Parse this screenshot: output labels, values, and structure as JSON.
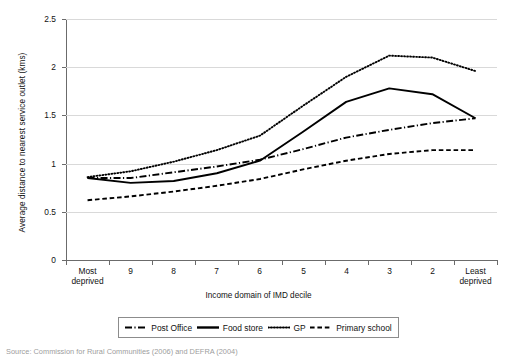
{
  "chart_data": {
    "type": "line",
    "title": "",
    "xlabel": "Income domain of IMD decile",
    "ylabel": "Average distance to nearest service outlet (kms)",
    "categories": [
      "Most deprived",
      "9",
      "8",
      "7",
      "6",
      "5",
      "4",
      "3",
      "2",
      "Least deprived"
    ],
    "ylim": [
      0,
      2.5
    ],
    "yticks": [
      "0",
      "0.5",
      "1",
      "1.5",
      "2",
      "2.5"
    ],
    "ytick_values": [
      0,
      0.5,
      1,
      1.5,
      2,
      2.5
    ],
    "grid": true,
    "legend_position": "bottom",
    "series": [
      {
        "name": "Post Office",
        "style": "long-dash-dot",
        "color": "#000000",
        "values": [
          0.85,
          0.85,
          0.91,
          0.97,
          1.04,
          1.15,
          1.27,
          1.35,
          1.42,
          1.47
        ]
      },
      {
        "name": "Food store",
        "style": "solid",
        "color": "#000000",
        "values": [
          0.85,
          0.8,
          0.82,
          0.9,
          1.03,
          1.33,
          1.64,
          1.78,
          1.72,
          1.47
        ]
      },
      {
        "name": "GP",
        "style": "dotted",
        "color": "#000000",
        "values": [
          0.86,
          0.92,
          1.02,
          1.14,
          1.29,
          1.6,
          1.9,
          2.12,
          2.1,
          1.96
        ]
      },
      {
        "name": "Primary school",
        "style": "dashed",
        "color": "#000000",
        "values": [
          0.62,
          0.66,
          0.71,
          0.77,
          0.84,
          0.94,
          1.03,
          1.1,
          1.14,
          1.14
        ]
      }
    ]
  },
  "axis": {
    "y_title": "Average distance to nearest service outlet (kms)",
    "x_title": "Income domain of IMD decile"
  },
  "legend": {
    "items": [
      {
        "label": "Post Office",
        "style": "long-dash-dot"
      },
      {
        "label": "Food store",
        "style": "solid"
      },
      {
        "label": "GP",
        "style": "dotted"
      },
      {
        "label": "Primary school",
        "style": "dashed"
      }
    ]
  },
  "source": {
    "text": "Source: Commission for Rural Communities (2006) and DEFRA (2004)"
  }
}
